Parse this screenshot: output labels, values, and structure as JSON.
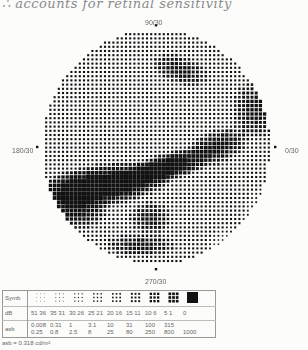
{
  "annotation": {
    "handwritten_note": "∴ accounts for retinal sensitivity"
  },
  "plot": {
    "axis_labels": {
      "top": "90/30",
      "bottom": "270/30",
      "left": "180/30",
      "right": "0/30"
    },
    "center": [
      156,
      147
    ],
    "radius_x": 114,
    "radius_y": 117,
    "grid_step": 4.2,
    "base_level": 3,
    "defects": [
      {
        "x": 105,
        "y": 185,
        "rx": 55,
        "ry": 18,
        "angle": -0.15,
        "level": 9
      },
      {
        "x": 165,
        "y": 168,
        "rx": 45,
        "ry": 12,
        "angle": -0.3,
        "level": 9
      },
      {
        "x": 215,
        "y": 148,
        "rx": 30,
        "ry": 14,
        "angle": -0.4,
        "level": 7
      },
      {
        "x": 75,
        "y": 200,
        "rx": 30,
        "ry": 25,
        "angle": 0,
        "level": 8
      },
      {
        "x": 180,
        "y": 70,
        "rx": 25,
        "ry": 12,
        "angle": 0.3,
        "level": 6
      },
      {
        "x": 255,
        "y": 110,
        "rx": 20,
        "ry": 25,
        "angle": 0,
        "level": 6
      },
      {
        "x": 140,
        "y": 245,
        "rx": 30,
        "ry": 10,
        "angle": 0,
        "level": 6
      },
      {
        "x": 150,
        "y": 218,
        "rx": 18,
        "ry": 14,
        "angle": 0,
        "level": 6
      },
      {
        "x": 230,
        "y": 250,
        "rx": 20,
        "ry": 20,
        "angle": 0,
        "level": 0
      },
      {
        "x": 265,
        "y": 220,
        "rx": 20,
        "ry": 30,
        "angle": 0,
        "level": 1
      }
    ]
  },
  "legend": {
    "row_labels": {
      "symbol": "Symb",
      "db": "dB",
      "asb": "asb"
    },
    "symbols": [
      {
        "level": 0,
        "db": "51  36",
        "asb_top": "0.008",
        "asb_bottom": "0.25"
      },
      {
        "level": 1,
        "db": "35  31",
        "asb_top": "0.31",
        "asb_bottom": "0.8"
      },
      {
        "level": 2,
        "db": "30  26",
        "asb_top": "1",
        "asb_bottom": "2.5"
      },
      {
        "level": 3,
        "db": "25  21",
        "asb_top": "3.1",
        "asb_bottom": "8"
      },
      {
        "level": 4,
        "db": "20  16",
        "asb_top": "10",
        "asb_bottom": "25"
      },
      {
        "level": 5,
        "db": "15  11",
        "asb_top": "31",
        "asb_bottom": "80"
      },
      {
        "level": 6,
        "db": "10  6",
        "asb_top": "100",
        "asb_bottom": "250"
      },
      {
        "level": 7,
        "db": "5  1",
        "asb_top": "315",
        "asb_bottom": "800"
      },
      {
        "level": 8,
        "db": "0",
        "asb_top": "1000",
        "asb_bottom": ""
      }
    ],
    "footnote": "asb = 0.318 cd/m²"
  }
}
